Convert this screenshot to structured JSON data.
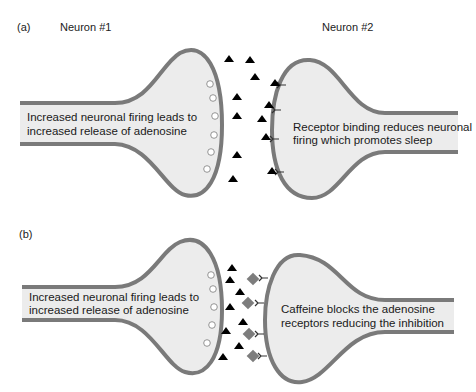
{
  "panel_a": {
    "label": "(a)",
    "neuron1_title": "Neuron #1",
    "neuron2_title": "Neuron #2",
    "neuron1_text": [
      "Increased neuronal firing leads to",
      "increased release of adenosine"
    ],
    "neuron2_text": [
      "Receptor binding reduces neuronal",
      "firing which promotes sleep"
    ]
  },
  "panel_b": {
    "label": "(b)",
    "neuron1_text": [
      "Increased neuronal firing leads to",
      "increased release of adenosine"
    ],
    "neuron2_text": [
      "Caffeine blocks the adenosine",
      "receptors reducing the inhibition"
    ]
  },
  "legend_symbols": {
    "adenosine": "black-triangle",
    "caffeine": "gray-diamond",
    "vesicle": "open-circle",
    "receptor": "y-shaped-receptor"
  },
  "colors": {
    "membrane": "#7a7a7a",
    "cytoplasm": "#ececec",
    "adenosine": "#000000",
    "caffeine": "#7d7d7d"
  }
}
